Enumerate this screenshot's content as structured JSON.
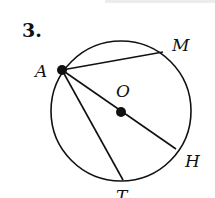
{
  "problem": {
    "number": "3.",
    "labels": {
      "A": "A",
      "M": "M",
      "O": "O",
      "H": "H",
      "T": "T"
    }
  },
  "diagram": {
    "circle": {
      "cx": 121,
      "cy": 111,
      "r": 70,
      "center_label": "O"
    },
    "points": {
      "A": [
        62,
        70
      ],
      "M": [
        163,
        52
      ],
      "O": [
        121,
        112
      ],
      "H": [
        176,
        149
      ],
      "T": [
        123,
        180
      ]
    },
    "segments": [
      [
        "A",
        "M"
      ],
      [
        "A",
        "H"
      ],
      [
        "A",
        "T"
      ]
    ]
  }
}
